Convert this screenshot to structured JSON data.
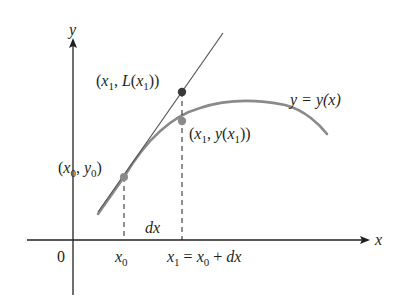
{
  "diagram": {
    "type": "linear-approximation",
    "axes": {
      "x_label": "x",
      "y_label": "y",
      "origin_label": "0"
    },
    "curve": {
      "label": "y = y(x)",
      "color": "#8a8a8a"
    },
    "tangent_line": {
      "color": "#555555"
    },
    "points": [
      {
        "id": "p0",
        "label_parts": [
          "(",
          "x",
          "0",
          ", ",
          "y",
          "0",
          ")"
        ],
        "color": "#8a8a8a"
      },
      {
        "id": "p_tangent",
        "label_parts": [
          "(",
          "x",
          "1",
          ", ",
          "L(",
          "x",
          "1",
          "))"
        ],
        "color": "#3a3a3a"
      },
      {
        "id": "p_curve",
        "label_parts": [
          "(",
          "x",
          "1",
          ", ",
          "y(",
          "x",
          "1",
          "))"
        ],
        "color": "#8a8a8a"
      }
    ],
    "x_ticks": {
      "x0": {
        "main": "x",
        "sub": "0"
      },
      "x1": {
        "main": "x",
        "sub": "1",
        "rest": " = ",
        "main2": "x",
        "sub2": "0",
        "rest2": " + dx"
      }
    },
    "increment_label": "dx"
  }
}
